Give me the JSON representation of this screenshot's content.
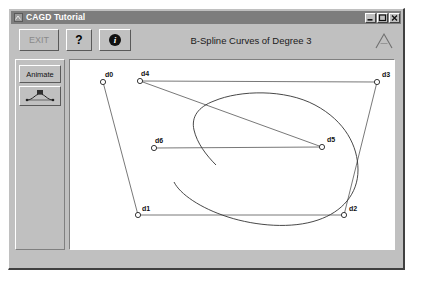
{
  "window": {
    "title": "CAGD Tutorial",
    "icon": "app-icon",
    "controls": [
      {
        "name": "minimize-button",
        "glyph": "minimize-icon"
      },
      {
        "name": "maximize-button",
        "glyph": "maximize-icon"
      },
      {
        "name": "close-button",
        "glyph": "close-icon"
      }
    ]
  },
  "toolbar": {
    "exit_label": "EXIT",
    "help_label": "?",
    "info_label": "i",
    "title": "B-Spline Curves of Degree 3",
    "logo": "peak-triangle-logo"
  },
  "sidebar": {
    "animate_label": "Animate",
    "curve_tool_label": "curve-tool-icon"
  },
  "chart_data": {
    "type": "line",
    "title": "B-Spline Curves of Degree 3",
    "xlabel": "",
    "ylabel": "",
    "xlim": [
      0,
      334
    ],
    "ylim": [
      0,
      196
    ],
    "grid": false,
    "legend": null,
    "control_points": [
      {
        "label": "d0",
        "x": 33,
        "y": 22,
        "label_dx": 2,
        "label_dy": -5
      },
      {
        "label": "d4",
        "x": 70,
        "y": 21,
        "label_dx": 1,
        "label_dy": -5
      },
      {
        "label": "d3",
        "x": 307,
        "y": 22,
        "label_dx": 5,
        "label_dy": -5
      },
      {
        "label": "d6",
        "x": 84,
        "y": 88,
        "label_dx": 1,
        "label_dy": -5
      },
      {
        "label": "d5",
        "x": 252,
        "y": 87,
        "label_dx": 5,
        "label_dy": -5
      },
      {
        "label": "d1",
        "x": 68,
        "y": 155,
        "label_dx": 4,
        "label_dy": -4
      },
      {
        "label": "d2",
        "x": 274,
        "y": 155,
        "label_dx": 5,
        "label_dy": -4
      }
    ],
    "control_polygon": [
      {
        "name": "d0-d1",
        "from": "d0",
        "to": "d1"
      },
      {
        "name": "d4-d3",
        "from": "d4",
        "to": "d3"
      },
      {
        "name": "d4-d5",
        "from": "d4",
        "to": "d5"
      },
      {
        "name": "d6-d5",
        "from": "d6",
        "to": "d5"
      },
      {
        "name": "d1-d2",
        "from": "d1",
        "to": "d2"
      },
      {
        "name": "d3-d2",
        "from": "d3",
        "to": "d2"
      }
    ],
    "curve_paths": [
      {
        "name": "bspline-curve-main",
        "d": "M 144 41 C 170 30, 215 29, 245 45 C 275 61, 288 86, 288 110 C 288 134, 272 152, 248 160 C 222 169, 186 166, 158 157 C 130 148, 110 134, 104 122"
      },
      {
        "name": "bspline-curve-inner",
        "d": "M 144 41 C 128 47, 121 57, 124 70 C 127 83, 136 95, 146 105"
      }
    ]
  }
}
